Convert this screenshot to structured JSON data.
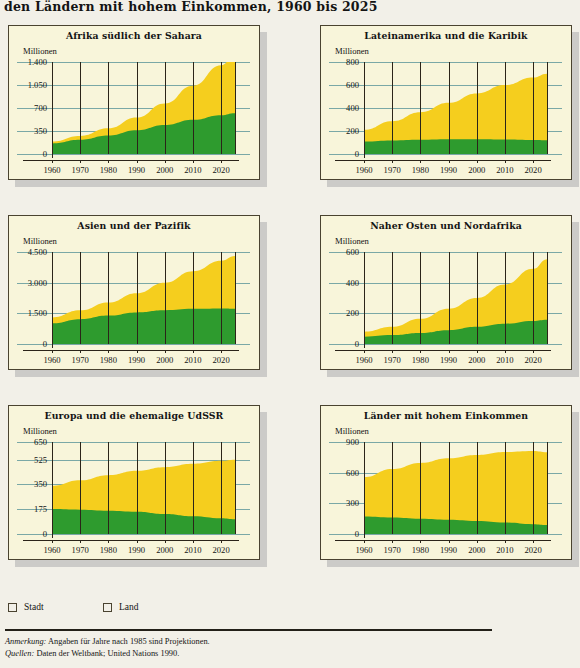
{
  "figure": {
    "title": "den Ländern mit hohem Einkommen, 1960 bis 2025"
  },
  "axis": {
    "unit_label": "Millionen",
    "x_ticks": [
      "1960",
      "1970",
      "1980",
      "1990",
      "2000",
      "2010",
      "2020"
    ]
  },
  "legend": {
    "items": [
      {
        "label": "Stadt",
        "color": "#f5ce1e"
      },
      {
        "label": "Land",
        "color": "#2e9b2e"
      }
    ]
  },
  "notes": {
    "note_label": "Anmerkung:",
    "note_text": " Angaben für Jahre nach 1985 sind Projektionen.",
    "source_label": "Quellen:",
    "source_text": " Daten der Weltbank; United Nations 1990."
  },
  "colors": {
    "urban": "#f5ce1e",
    "rural": "#2e9b2e",
    "panel_bg": "#f8f5da",
    "page_bg": "#f2f0e8",
    "gridline": "#7aa8a6",
    "axis": "#2b2419"
  },
  "chart_data": [
    {
      "type": "area",
      "title": "Afrika südlich der Sahara",
      "xlabel": "",
      "ylabel": "Millionen",
      "ylim": [
        0,
        1400
      ],
      "yticks": [
        0,
        350,
        700,
        1050,
        1400
      ],
      "ytick_labels": [
        "0",
        "350",
        "700",
        "1.050",
        "1.400"
      ],
      "grid": true,
      "legend_position": "bottom",
      "x": [
        1960,
        1970,
        1980,
        1990,
        2000,
        2010,
        2020,
        2025
      ],
      "series": [
        {
          "name": "Land",
          "values": [
            160,
            215,
            280,
            360,
            440,
            520,
            590,
            620
          ]
        },
        {
          "name": "Stadt",
          "values": [
            30,
            60,
            110,
            195,
            330,
            520,
            760,
            900
          ]
        }
      ],
      "totals": [
        190,
        275,
        390,
        555,
        770,
        1040,
        1350,
        1520
      ]
    },
    {
      "type": "area",
      "title": "Lateinamerika und die Karibik",
      "xlabel": "",
      "ylabel": "Millionen",
      "ylim": [
        0,
        800
      ],
      "yticks": [
        0,
        200,
        400,
        600,
        800
      ],
      "ytick_labels": [
        "0",
        "200",
        "400",
        "600",
        "800"
      ],
      "grid": true,
      "legend_position": "bottom",
      "x": [
        1960,
        1970,
        1980,
        1990,
        2000,
        2010,
        2020,
        2025
      ],
      "series": [
        {
          "name": "Land",
          "values": [
            108,
            118,
            124,
            128,
            128,
            126,
            122,
            120
          ]
        },
        {
          "name": "Stadt",
          "values": [
            102,
            167,
            239,
            317,
            399,
            473,
            543,
            578
          ]
        }
      ],
      "totals": [
        210,
        285,
        363,
        445,
        527,
        599,
        665,
        698
      ]
    },
    {
      "type": "area",
      "title": "Asien und der Pazifik",
      "xlabel": "",
      "ylabel": "Millionen",
      "ylim": [
        0,
        4500
      ],
      "yticks": [
        0,
        1500,
        3000,
        4500
      ],
      "ytick_labels": [
        "0",
        "1.500",
        "3.000",
        "4.500"
      ],
      "grid": true,
      "legend_position": "bottom",
      "x": [
        1960,
        1970,
        1980,
        1990,
        2000,
        2010,
        2020,
        2025
      ],
      "series": [
        {
          "name": "Land",
          "values": [
            1010,
            1215,
            1390,
            1545,
            1650,
            1720,
            1740,
            1730
          ]
        },
        {
          "name": "Stadt",
          "values": [
            290,
            430,
            640,
            940,
            1350,
            1840,
            2330,
            2570
          ]
        }
      ],
      "totals": [
        1300,
        1645,
        2030,
        2485,
        3000,
        3560,
        4070,
        4300
      ]
    },
    {
      "type": "area",
      "title": "Naher Osten und Nordafrika",
      "xlabel": "",
      "ylabel": "Millionen",
      "ylim": [
        0,
        600
      ],
      "yticks": [
        0,
        200,
        400,
        600
      ],
      "ytick_labels": [
        "0",
        "200",
        "400",
        "600"
      ],
      "grid": true,
      "legend_position": "bottom",
      "x": [
        1960,
        1970,
        1980,
        1990,
        2000,
        2010,
        2020,
        2025
      ],
      "series": [
        {
          "name": "Land",
          "values": [
            48,
            58,
            72,
            90,
            112,
            132,
            150,
            158
          ]
        },
        {
          "name": "Stadt",
          "values": [
            32,
            54,
            92,
            140,
            188,
            256,
            340,
            395
          ]
        }
      ],
      "totals": [
        80,
        112,
        164,
        230,
        300,
        388,
        490,
        553
      ]
    },
    {
      "type": "area",
      "title": "Europa und die ehemalige UdSSR",
      "xlabel": "",
      "ylabel": "Millionen",
      "ylim": [
        0,
        650
      ],
      "yticks": [
        0,
        175,
        350,
        525,
        650
      ],
      "ytick_labels": [
        "0",
        "175",
        "350",
        "525",
        "650"
      ],
      "grid": true,
      "legend_position": "bottom",
      "x": [
        1960,
        1970,
        1980,
        1990,
        2000,
        2010,
        2020,
        2025
      ],
      "series": [
        {
          "name": "Land",
          "values": [
            176,
            172,
            165,
            158,
            142,
            126,
            112,
            105
          ]
        },
        {
          "name": "Stadt",
          "values": [
            164,
            207,
            250,
            288,
            330,
            370,
            405,
            420
          ]
        }
      ],
      "totals": [
        340,
        379,
        415,
        446,
        472,
        496,
        517,
        525
      ]
    },
    {
      "type": "area",
      "title": "Länder mit hohem Einkommen",
      "xlabel": "",
      "ylabel": "Millionen",
      "ylim": [
        0,
        900
      ],
      "yticks": [
        0,
        300,
        600,
        900
      ],
      "ytick_labels": [
        "0",
        "300",
        "600",
        "900"
      ],
      "grid": true,
      "legend_position": "bottom",
      "x": [
        1960,
        1970,
        1980,
        1990,
        2000,
        2010,
        2020,
        2025
      ],
      "series": [
        {
          "name": "Land",
          "values": [
            172,
            162,
            150,
            140,
            128,
            112,
            96,
            88
          ]
        },
        {
          "name": "Stadt",
          "values": [
            383,
            473,
            545,
            600,
            645,
            690,
            716,
            712
          ]
        }
      ],
      "totals": [
        555,
        635,
        695,
        740,
        773,
        802,
        812,
        800
      ]
    }
  ]
}
